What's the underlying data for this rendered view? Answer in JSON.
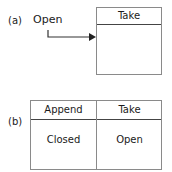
{
  "diagram_a": {
    "label": "(a)",
    "source_state": "Open",
    "box": {
      "header": "Take"
    }
  },
  "diagram_b": {
    "label": "(b)",
    "columns": [
      {
        "header": "Append",
        "value": "Closed"
      },
      {
        "header": "Take",
        "value": "Open"
      }
    ]
  }
}
